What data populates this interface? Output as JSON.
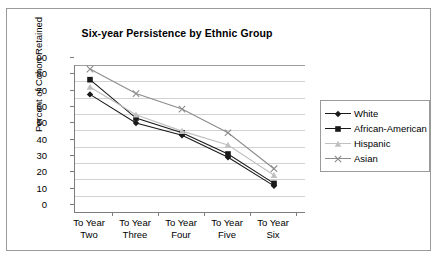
{
  "chart_data": {
    "type": "line",
    "title": "Six-year Persistence by Ethnic Group",
    "xlabel": "",
    "ylabel": "Percent of Cohort Retained",
    "ylim": [
      0,
      90
    ],
    "ystep": 10,
    "yticks": [
      "90",
      "80",
      "70",
      "60",
      "50",
      "40",
      "30",
      "20",
      "10",
      "0"
    ],
    "grid": true,
    "legend_position": "right",
    "categories": [
      "To Year\nTwo",
      "To Year\nThree",
      "To Year\nFour",
      "To Year\nFive",
      "To Year\nSix"
    ],
    "category_lines": [
      [
        "To Year",
        "Two"
      ],
      [
        "To Year",
        "Three"
      ],
      [
        "To Year",
        "Four"
      ],
      [
        "To Year",
        "Five"
      ],
      [
        "To Year",
        "Six"
      ]
    ],
    "series": [
      {
        "name": "White",
        "marker": "diamond",
        "color": "#1a1a1a",
        "values": [
          66.5,
          49,
          41.5,
          28,
          10.5
        ]
      },
      {
        "name": "African-American",
        "marker": "square",
        "color": "#1a1a1a",
        "values": [
          75.5,
          52,
          43,
          30,
          12
        ]
      },
      {
        "name": "Hispanic",
        "marker": "triangle",
        "color": "#c0c0c0",
        "values": [
          71,
          54,
          44,
          35.5,
          17
        ]
      },
      {
        "name": "Asian",
        "marker": "cross",
        "color": "#8c8c8c",
        "values": [
          82,
          67,
          57.5,
          43,
          21
        ]
      }
    ]
  },
  "legend": {
    "items": [
      {
        "label": "White"
      },
      {
        "label": "African-American"
      },
      {
        "label": "Hispanic"
      },
      {
        "label": "Asian"
      }
    ]
  }
}
